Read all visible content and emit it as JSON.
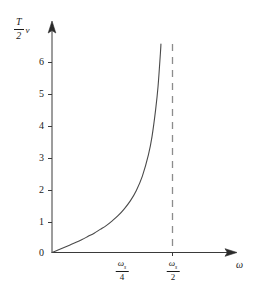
{
  "figure": {
    "name": "sampling-phase-delay-curve",
    "background_color": "#ffffff",
    "line_color": "#404040",
    "axis_color": "#3a3a3a",
    "dash_color": "#808080"
  },
  "axes": {
    "y_title_numerator": "T",
    "y_title_denominator": "2",
    "y_title_factor": "ν",
    "x_title": "ω",
    "origin_label": "0"
  },
  "chart_data": {
    "type": "line",
    "title": "",
    "subtitle": "",
    "xlabel": "ω",
    "ylabel": "(T/2)ν",
    "grid": false,
    "legend": false,
    "xlim": [
      0,
      0.64
    ],
    "ylim": [
      0,
      6.6
    ],
    "x_unit": "ωs",
    "x_tick_labels": [
      "ωs/4",
      "ωs/2"
    ],
    "x_tick_values": [
      0.25,
      0.5
    ],
    "y_tick_labels": [
      "0",
      "1",
      "2",
      "3",
      "4",
      "5",
      "6"
    ],
    "y_tick_values": [
      0,
      1,
      2,
      3,
      4,
      5,
      6
    ],
    "asymptote": {
      "type": "vertical-dashed",
      "x": 0.5,
      "label": "ωs/2"
    },
    "series": [
      {
        "name": "(T/2)ν",
        "style": "solid",
        "x": [
          0.0,
          0.025,
          0.05,
          0.075,
          0.1,
          0.125,
          0.15,
          0.175,
          0.2,
          0.225,
          0.25,
          0.275,
          0.3,
          0.325,
          0.35,
          0.375,
          0.4,
          0.415,
          0.43,
          0.44,
          0.45,
          0.458,
          0.464,
          0.468,
          0.471,
          0.474
        ],
        "y": [
          0.0,
          0.08,
          0.16,
          0.24,
          0.32,
          0.41,
          0.51,
          0.61,
          0.73,
          0.85,
          1.0,
          1.17,
          1.38,
          1.63,
          1.96,
          2.41,
          3.08,
          3.66,
          4.51,
          5.24,
          6.31,
          7.4,
          8.4,
          9.3,
          10.2,
          11.0
        ]
      }
    ]
  },
  "ticks": {
    "y": [
      {
        "label": "6",
        "value": 6
      },
      {
        "label": "5",
        "value": 5
      },
      {
        "label": "4",
        "value": 4
      },
      {
        "label": "3",
        "value": 3
      },
      {
        "label": "2",
        "value": 2
      },
      {
        "label": "1",
        "value": 1
      }
    ],
    "x": [
      {
        "numerator_symbol": "ω",
        "numerator_subscript": "s",
        "denominator": "4"
      },
      {
        "numerator_symbol": "ω",
        "numerator_subscript": "s",
        "denominator": "2"
      }
    ]
  }
}
